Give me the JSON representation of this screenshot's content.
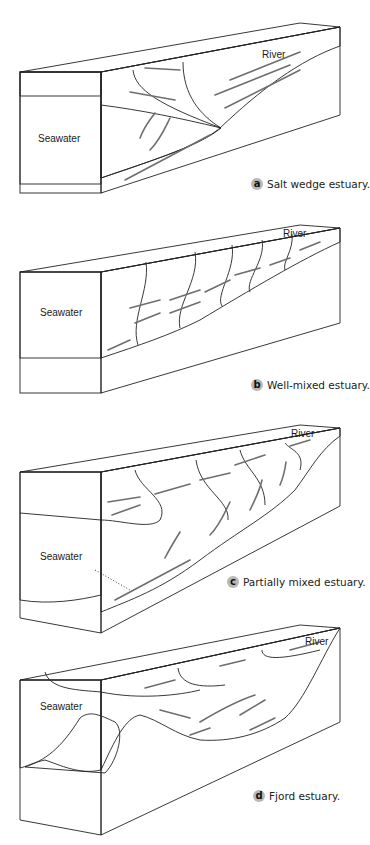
{
  "figure": {
    "panels": [
      {
        "id": "a",
        "badge": "a",
        "caption": "Salt wedge estuary.",
        "river_label": "River",
        "sea_label": "Seawater"
      },
      {
        "id": "b",
        "badge": "b",
        "caption": "Well-mixed estuary.",
        "river_label": "River",
        "sea_label": "Seawater"
      },
      {
        "id": "c",
        "badge": "c",
        "caption": "Partially mixed estuary.",
        "river_label": "River",
        "sea_label": "Seawater"
      },
      {
        "id": "d",
        "badge": "d",
        "caption": "Fjord estuary.",
        "river_label": "River",
        "sea_label": "Seawater"
      }
    ]
  },
  "colors": {
    "seawater_face": "#8f8f8f",
    "front_top_band": "#a8a8a8",
    "water_side": "#b9b9b9",
    "top_surface": "#d2d2d2",
    "land_side": "#ececec",
    "land_front": "#e2e2e2",
    "arrow": "#6e6e6e",
    "badge_bg": "#b8b8b8"
  }
}
